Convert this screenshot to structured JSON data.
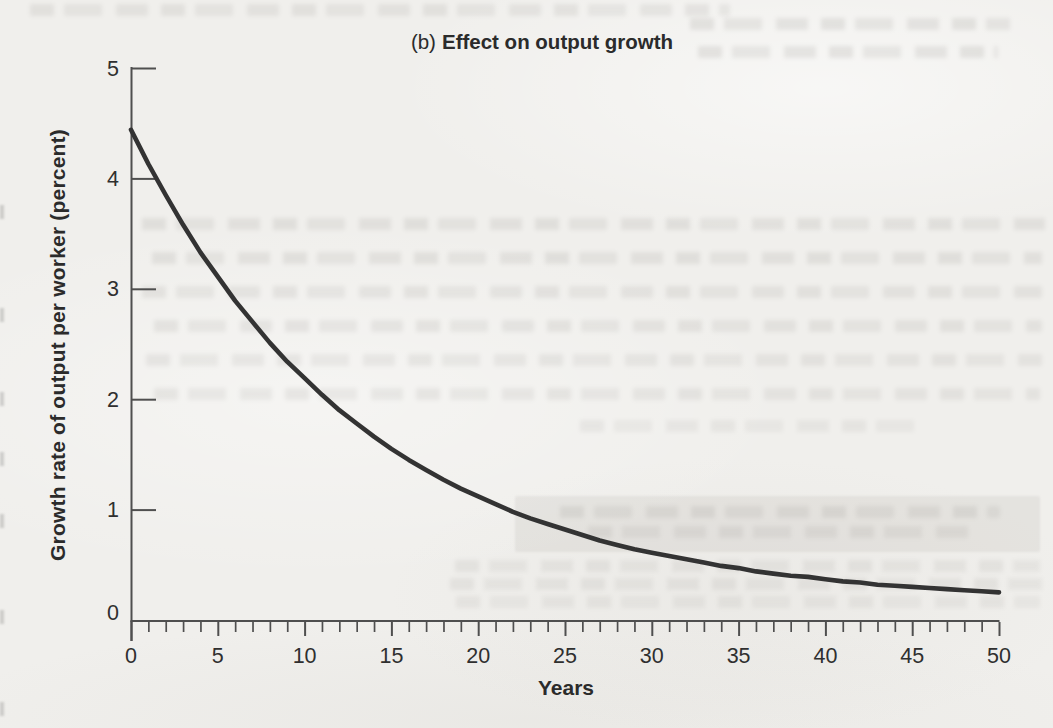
{
  "figure": {
    "panel_label": "(b)",
    "panel_title": "Effect on output growth"
  },
  "chart_data": {
    "type": "line",
    "xlabel": "Years",
    "ylabel": "Growth rate of output per worker (percent)",
    "xlim": [
      0,
      50
    ],
    "ylim": [
      0,
      5
    ],
    "x_major_ticks": [
      0,
      5,
      10,
      15,
      20,
      25,
      30,
      35,
      40,
      45,
      50
    ],
    "x_minor_tick_step": 1,
    "y_ticks": [
      0,
      1,
      2,
      3,
      4,
      5
    ],
    "grid": false,
    "legend": "none",
    "series": [
      {
        "name": "growth-rate-of-output-per-worker",
        "color": "#333333",
        "x": [
          0,
          1,
          2,
          3,
          4,
          5,
          6,
          7,
          8,
          9,
          10,
          11,
          12,
          13,
          14,
          15,
          16,
          17,
          18,
          19,
          20,
          21,
          22,
          23,
          24,
          25,
          26,
          27,
          28,
          29,
          30,
          31,
          32,
          33,
          34,
          35,
          36,
          37,
          38,
          39,
          40,
          41,
          42,
          43,
          44,
          45,
          46,
          47,
          48,
          49,
          50
        ],
        "y": [
          4.44,
          4.13,
          3.85,
          3.58,
          3.33,
          3.11,
          2.89,
          2.7,
          2.51,
          2.34,
          2.19,
          2.04,
          1.9,
          1.78,
          1.66,
          1.55,
          1.45,
          1.36,
          1.27,
          1.19,
          1.12,
          1.05,
          0.98,
          0.92,
          0.87,
          0.82,
          0.77,
          0.72,
          0.68,
          0.64,
          0.61,
          0.58,
          0.55,
          0.52,
          0.49,
          0.47,
          0.44,
          0.42,
          0.4,
          0.39,
          0.37,
          0.35,
          0.34,
          0.32,
          0.31,
          0.3,
          0.29,
          0.28,
          0.27,
          0.26,
          0.25
        ]
      }
    ]
  },
  "colors": {
    "paper": "#f0efec",
    "ink": "#2b2b2b",
    "axis": "#4f4f4f",
    "curve": "#333333"
  }
}
